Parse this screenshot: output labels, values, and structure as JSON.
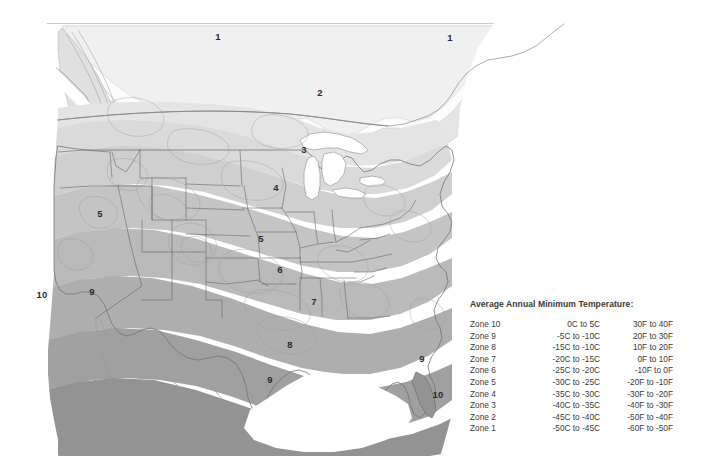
{
  "background": "#ffffff",
  "rule_color": "#c9c9c9",
  "map": {
    "name": "north-america-plant-hardiness-zone-map",
    "zone_labels": [
      {
        "id": "zone-1-canada-west",
        "text": "1",
        "x": 218,
        "y": 37
      },
      {
        "id": "zone-1-canada-east",
        "text": "1",
        "x": 450,
        "y": 38
      },
      {
        "id": "zone-2-canada",
        "text": "2",
        "x": 320,
        "y": 93
      },
      {
        "id": "zone-3-minnesota",
        "text": "3",
        "x": 304,
        "y": 150
      },
      {
        "id": "zone-4-dakotas",
        "text": "4",
        "x": 276,
        "y": 188
      },
      {
        "id": "zone-5-nevada",
        "text": "5",
        "x": 100,
        "y": 214
      },
      {
        "id": "zone-5-kansas",
        "text": "5",
        "x": 261,
        "y": 239
      },
      {
        "id": "zone-6-kansas",
        "text": "6",
        "x": 280,
        "y": 270
      },
      {
        "id": "zone-7-arkansas",
        "text": "7",
        "x": 314,
        "y": 302
      },
      {
        "id": "zone-8-texas",
        "text": "8",
        "x": 290,
        "y": 345
      },
      {
        "id": "zone-9-texas",
        "text": "9",
        "x": 270,
        "y": 380
      },
      {
        "id": "zone-9-california",
        "text": "9",
        "x": 92,
        "y": 292
      },
      {
        "id": "zone-10-pacific",
        "text": "10",
        "x": 42,
        "y": 295
      },
      {
        "id": "zone-9-florida",
        "text": "9",
        "x": 422,
        "y": 359
      },
      {
        "id": "zone-10-florida",
        "text": "10",
        "x": 438,
        "y": 395
      }
    ],
    "zone_fills": {
      "zone_1": "#fbfbfb",
      "zone_2": "#f1f1f1",
      "zone_3": "#e6e6e6",
      "zone_4": "#dcdcdc",
      "zone_5": "#d2d2d2",
      "zone_6": "#c6c6c6",
      "zone_7": "#bcbcbc",
      "zone_8": "#b0b0b0",
      "zone_9": "#a2a2a2",
      "zone_10": "#949494",
      "water": "#ffffff",
      "unshaded_land": "#ffffff",
      "border_line": "#6f6f6f",
      "contour_line": "#9a9a9a"
    }
  },
  "legend": {
    "title": "Average Annual Minimum Temperature:",
    "columns": [
      "Zone",
      "Celsius",
      "Fahrenheit"
    ],
    "rows": [
      {
        "zone": "Zone 10",
        "celsius": "0C to 5C",
        "fahrenheit": "30F to 40F"
      },
      {
        "zone": "Zone 9",
        "celsius": "-5C to -10C",
        "fahrenheit": "20F to 30F"
      },
      {
        "zone": "Zone 8",
        "celsius": "-15C to -10C",
        "fahrenheit": "10F to 20F"
      },
      {
        "zone": "Zone 7",
        "celsius": "-20C to -15C",
        "fahrenheit": "0F to 10F"
      },
      {
        "zone": "Zone 6",
        "celsius": "-25C to -20C",
        "fahrenheit": "-10F to 0F"
      },
      {
        "zone": "Zone 5",
        "celsius": "-30C to -25C",
        "fahrenheit": "-20F to -10F"
      },
      {
        "zone": "Zone 4",
        "celsius": "-35C to -30C",
        "fahrenheit": "-30F to -20F"
      },
      {
        "zone": "Zone 3",
        "celsius": "-40C to -35C",
        "fahrenheit": "-40F to -30F"
      },
      {
        "zone": "Zone 2",
        "celsius": "-45C to -40C",
        "fahrenheit": "-50F to -40F"
      },
      {
        "zone": "Zone 1",
        "celsius": "-50C to -45C",
        "fahrenheit": "-60F to -50F"
      }
    ]
  }
}
